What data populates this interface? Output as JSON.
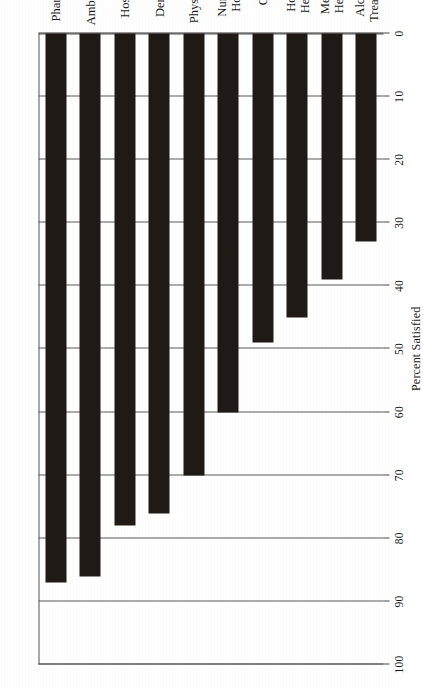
{
  "figure": {
    "orientation": "rotated-90-ccw",
    "background_color": "#ffffff",
    "bar_color": "#201a16",
    "axis_color": "#4a4a4a"
  },
  "chart_data": {
    "type": "bar",
    "orientation": "horizontal",
    "title": "",
    "xlabel": "",
    "ylabel": "Percent Satisfied",
    "ylim": [
      0,
      100
    ],
    "grid": true,
    "legend": "none",
    "categories": [
      "Pharmacy",
      "Ambulance",
      "Hospital",
      "Dentists",
      "Physicians",
      "Nursing Home",
      "OB",
      "Home Health",
      "Mental Health",
      "Alcohol Treatment"
    ],
    "values": [
      87,
      86,
      78,
      76,
      70,
      60,
      49,
      45,
      39,
      33
    ],
    "tick_labels": [
      "100",
      "90",
      "80",
      "70",
      "60",
      "50",
      "40",
      "30",
      "20",
      "10",
      "0"
    ],
    "tick_values": [
      100,
      90,
      80,
      70,
      60,
      50,
      40,
      30,
      20,
      10,
      0
    ]
  },
  "axis": {
    "value_axis_title": "Percent Satisfied"
  },
  "categories_multiline": [
    [
      "Pharmacy"
    ],
    [
      "Ambulance"
    ],
    [
      "Hospital"
    ],
    [
      "Dentists"
    ],
    [
      "Physicians"
    ],
    [
      "Nursing",
      "Home"
    ],
    [
      "OB"
    ],
    [
      "Home",
      "Health"
    ],
    [
      "Mental",
      "Health"
    ],
    [
      "Alcohol",
      "Treatment"
    ]
  ]
}
